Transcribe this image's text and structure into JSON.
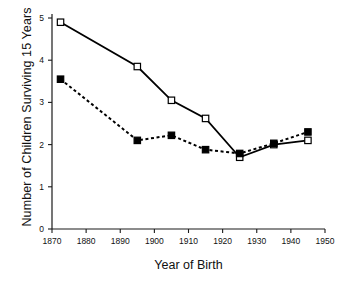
{
  "chart_data": {
    "type": "line",
    "title": "",
    "xlabel": "Year of Birth",
    "ylabel": "Number of Children Surviving 15 Years",
    "xlim": [
      1870,
      1950
    ],
    "ylim": [
      0,
      5
    ],
    "xticks": [
      1870,
      1880,
      1890,
      1900,
      1910,
      1920,
      1930,
      1940,
      1950
    ],
    "yticks": [
      0,
      1,
      2,
      3,
      4,
      5
    ],
    "grid": false,
    "legend": "none",
    "series": [
      {
        "name": "solid-open-square",
        "line_style": "solid",
        "marker": "open-square",
        "color": "#000000",
        "x": [
          1872.5,
          1895,
          1905,
          1915,
          1925,
          1935,
          1945
        ],
        "values": [
          4.9,
          3.85,
          3.05,
          2.62,
          1.7,
          2.0,
          2.1
        ]
      },
      {
        "name": "dashed-filled-square",
        "line_style": "dashed",
        "marker": "filled-square",
        "color": "#000000",
        "x": [
          1872.5,
          1895,
          1905,
          1915,
          1925,
          1935,
          1945
        ],
        "values": [
          3.55,
          2.1,
          2.22,
          1.88,
          1.79,
          2.03,
          2.3
        ]
      }
    ]
  },
  "axis": {
    "x_tick_labels": [
      "1870",
      "1880",
      "1890",
      "1900",
      "1910",
      "1920",
      "1930",
      "1940",
      "1950"
    ],
    "y_tick_labels": [
      "0",
      "1",
      "2",
      "3",
      "4",
      "5"
    ]
  },
  "labels": {
    "x_axis_title": "Year of Birth",
    "y_axis_title": "Number of Children Surviving 15 Years"
  }
}
